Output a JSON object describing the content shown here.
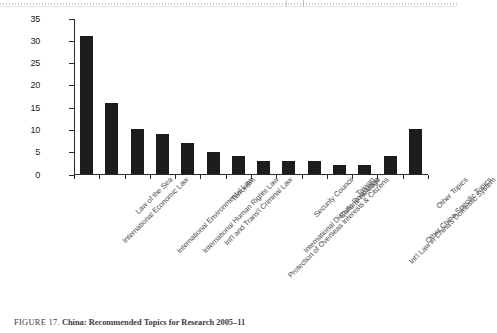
{
  "figure": {
    "caption_label": "FIGURE 17.",
    "caption_text": "China: Recommended Topics for Research 2005–11"
  },
  "chart_data": {
    "type": "bar",
    "title": "",
    "xlabel": "",
    "ylabel": "",
    "ylim": [
      0,
      35
    ],
    "ytick_step": 5,
    "grid": false,
    "legend": "none",
    "bar_color": "#1c1c1c",
    "categories": [
      "International Economic Law",
      "Law of the Sea",
      "International Environmental Law",
      "International Human Rights Law",
      "Int'l and Trans'l Criminal Law",
      "Terrorism",
      "Protection of Overseas Interests & Citizens",
      "International Dispute Resolution",
      "Security Council",
      "Cultural Heritage",
      "Taiwan",
      "Int'l Law in China's Domestic System",
      "Other China-Specific Topics",
      "Other Topics"
    ],
    "values": [
      31,
      16,
      10,
      9,
      7,
      5,
      4,
      3,
      3,
      3,
      2,
      2,
      4,
      10
    ],
    "ytick_labels": [
      "0",
      "5",
      "10",
      "15",
      "20",
      "25",
      "30",
      "35"
    ]
  }
}
